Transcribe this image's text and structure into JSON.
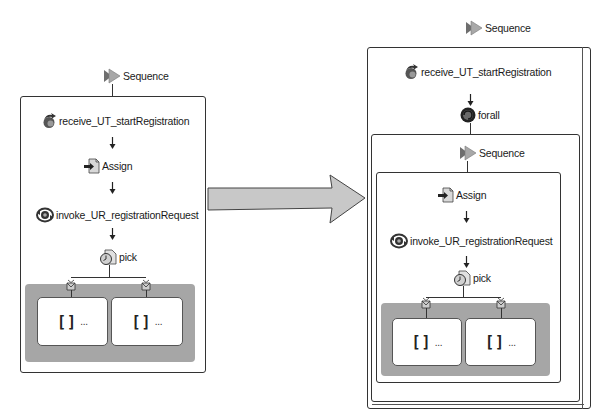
{
  "colors": {
    "border": "#333333",
    "pick_area": "#a6a6a6",
    "big_arrow_fill": "#c8c8c8",
    "sequence_icon": "#8a8a8a"
  },
  "before": {
    "sequence_label": "Sequence",
    "nodes": [
      {
        "icon": "receive-icon",
        "label": "receive_UT_startRegistration"
      },
      {
        "icon": "assign-icon",
        "label": "Assign"
      },
      {
        "icon": "invoke-icon",
        "label": "invoke_UR_registrationRequest"
      },
      {
        "icon": "pick-icon",
        "label": "pick"
      }
    ],
    "branches": [
      {
        "icon": "on-message-icon",
        "content": "[]",
        "ellipsis": "..."
      },
      {
        "icon": "on-message-icon",
        "content": "[]",
        "ellipsis": "..."
      }
    ]
  },
  "transform_arrow": {
    "icon": "right-arrow-icon"
  },
  "after": {
    "outer_sequence_label": "Sequence",
    "receive_label": "receive_UT_startRegistration",
    "forall_label": "forall",
    "inner_sequence_label": "Sequence",
    "nodes": [
      {
        "icon": "assign-icon",
        "label": "Assign"
      },
      {
        "icon": "invoke-icon",
        "label": "invoke_UR_registrationRequest"
      },
      {
        "icon": "pick-icon",
        "label": "pick"
      }
    ],
    "branches": [
      {
        "icon": "on-message-icon",
        "content": "[]",
        "ellipsis": "..."
      },
      {
        "icon": "on-message-icon",
        "content": "[]",
        "ellipsis": "..."
      }
    ]
  }
}
